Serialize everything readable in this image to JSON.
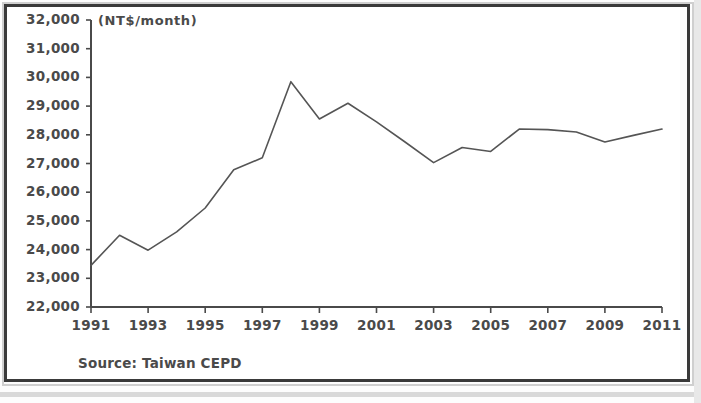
{
  "figure": {
    "unit_label": "(NT$/month)",
    "source_note": "Source: Taiwan CEPD"
  },
  "chart_data": {
    "type": "line",
    "title": "",
    "subtitle": "",
    "xlabel": "",
    "ylabel": "(NT$/month)",
    "annotation": "Source: Taiwan CEPD",
    "grid": false,
    "legend": "none",
    "line_color": "#555555",
    "xlim": [
      1991,
      2011
    ],
    "ylim": [
      22000,
      32000
    ],
    "ytick_step": 1000,
    "xtick_step": 2,
    "ytick_labels": [
      "32,000",
      "31,000",
      "30,000",
      "29,000",
      "28,000",
      "27,000",
      "26,000",
      "25,000",
      "24,000",
      "23,000",
      "22,000"
    ],
    "ytick_values": [
      32000,
      31000,
      30000,
      29000,
      28000,
      27000,
      26000,
      25000,
      24000,
      23000,
      22000
    ],
    "xtick_labels": [
      "1991",
      "1993",
      "1995",
      "1997",
      "1999",
      "2001",
      "2003",
      "2005",
      "2007",
      "2009",
      "2011"
    ],
    "xtick_values": [
      1991,
      1993,
      1995,
      1997,
      1999,
      2001,
      2003,
      2005,
      2007,
      2009,
      2011
    ],
    "x": [
      1991,
      1992,
      1993,
      1994,
      1995,
      1996,
      1997,
      1998,
      1999,
      2000,
      2001,
      2002,
      2003,
      2004,
      2005,
      2006,
      2007,
      2008,
      2009,
      2010,
      2011
    ],
    "values": [
      23450,
      24500,
      23980,
      24620,
      25450,
      26780,
      27200,
      29850,
      28550,
      29100,
      28450,
      27750,
      27030,
      27560,
      27420,
      28200,
      28180,
      28100,
      27750,
      27980,
      28200
    ],
    "series": [
      {
        "name": "Average monthly earnings",
        "values": [
          23450,
          24500,
          23980,
          24620,
          25450,
          26780,
          27200,
          29850,
          28550,
          29100,
          28450,
          27750,
          27030,
          27560,
          27420,
          28200,
          28180,
          28100,
          27750,
          27980,
          28200
        ]
      }
    ]
  }
}
